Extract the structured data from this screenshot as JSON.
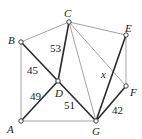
{
  "diagram": {
    "type": "weighted-graph",
    "vertices": [
      {
        "id": "A",
        "label": "A",
        "x": 21,
        "y": 121
      },
      {
        "id": "B",
        "label": "B",
        "x": 21,
        "y": 42
      },
      {
        "id": "C",
        "label": "C",
        "x": 69,
        "y": 22
      },
      {
        "id": "D",
        "label": "D",
        "x": 58,
        "y": 81
      },
      {
        "id": "E",
        "label": "E",
        "x": 126,
        "y": 35
      },
      {
        "id": "F",
        "label": "F",
        "x": 126,
        "y": 86
      },
      {
        "id": "G",
        "label": "G",
        "x": 96,
        "y": 121
      }
    ],
    "edges": [
      {
        "from": "A",
        "to": "B",
        "weight": "",
        "style": "thin"
      },
      {
        "from": "B",
        "to": "C",
        "weight": "",
        "style": "thin"
      },
      {
        "from": "C",
        "to": "E",
        "weight": "",
        "style": "thin"
      },
      {
        "from": "E",
        "to": "F",
        "weight": "",
        "style": "thin"
      },
      {
        "from": "A",
        "to": "G",
        "weight": "",
        "style": "thin"
      },
      {
        "from": "C",
        "to": "G",
        "weight": "",
        "style": "thin"
      },
      {
        "from": "C",
        "to": "F",
        "weight": "",
        "style": "thin"
      },
      {
        "from": "B",
        "to": "D",
        "weight": "45",
        "style": "thick"
      },
      {
        "from": "D",
        "to": "C",
        "weight": "53",
        "style": "thick"
      },
      {
        "from": "A",
        "to": "D",
        "weight": "49",
        "style": "thick"
      },
      {
        "from": "D",
        "to": "G",
        "weight": "51",
        "style": "thick"
      },
      {
        "from": "G",
        "to": "E",
        "weight": "x",
        "style": "thick"
      },
      {
        "from": "G",
        "to": "F",
        "weight": "42",
        "style": "thick"
      }
    ],
    "labels": {
      "A": "A",
      "B": "B",
      "C": "C",
      "D": "D",
      "E": "E",
      "F": "F",
      "G": "G",
      "w_BD": "45",
      "w_DC": "53",
      "w_AD": "49",
      "w_DG": "51",
      "w_GE": "x",
      "w_GF": "42"
    }
  }
}
